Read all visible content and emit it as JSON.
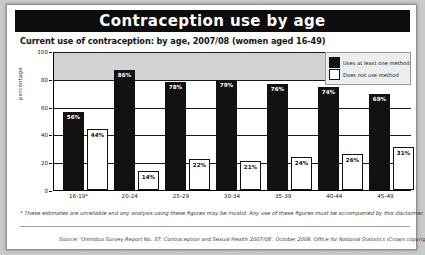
{
  "header": {
    "title": "Contraception use by age"
  },
  "subtitle": "Current use of contraception: by age, 2007/08 (women aged 16-49)",
  "legend": {
    "series_dark": "Uses at least one method",
    "series_light": "Does not use method"
  },
  "footnote": "* These estimates are unreliable and any analysis using these figures may be invalid. Any use of these figures must be accompanied by this disclaimer.",
  "source": "Source: 'Omnibus Survey Report No. 37: Contraception and Sexual Health 2007/08', October 2008, Office for National Statistics (Crown copyright)",
  "colors": {
    "title_bar": "#0d0d0d",
    "dark_series": "#111111",
    "light_series": "#ffffff",
    "band": "#d2d2d2"
  },
  "chart_data": {
    "type": "bar",
    "title": "Contraception use by age",
    "subtitle": "Current use of contraception: by age, 2007/08 (women aged 16-49)",
    "xlabel": "",
    "ylabel": "percentage",
    "ylim": [
      0,
      100
    ],
    "yticks": [
      0,
      20,
      40,
      60,
      80,
      100
    ],
    "ytick_labels": [
      "0",
      "20",
      "40",
      "60",
      "80",
      "100"
    ],
    "grid": true,
    "legend_position": "top-right",
    "categories": [
      "16-19*",
      "20-24",
      "25-29",
      "30-34",
      "35-39",
      "40-44",
      "45-49"
    ],
    "series": [
      {
        "name": "Uses at least one method",
        "values": [
          56,
          86,
          78,
          79,
          76,
          74,
          69
        ],
        "labels": [
          "56%",
          "86%",
          "78%",
          "79%",
          "76%",
          "74%",
          "69%"
        ]
      },
      {
        "name": "Does not use method",
        "values": [
          44,
          14,
          22,
          21,
          24,
          26,
          31
        ],
        "labels": [
          "44%",
          "14%",
          "22%",
          "21%",
          "24%",
          "26%",
          "31%"
        ]
      }
    ],
    "shaded_band": {
      "from": 80,
      "to": 100
    },
    "annotations": [
      "* These estimates are unreliable and any analysis using these figures may be invalid. Any use of these figures must be accompanied by this disclaimer."
    ]
  }
}
